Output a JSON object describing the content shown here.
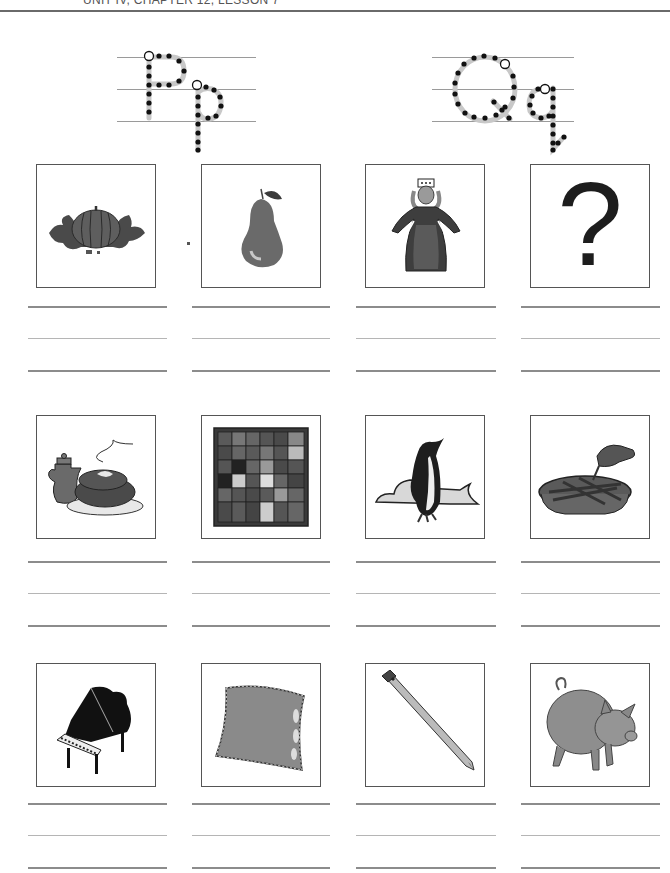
{
  "header": {
    "lesson_label": "UNIT IV, CHAPTER 12, LESSON 7"
  },
  "letters": [
    {
      "name": "P",
      "upper": "P",
      "lower": "p"
    },
    {
      "name": "Q",
      "upper": "Q",
      "lower": "q"
    }
  ],
  "pictures": [
    {
      "row": 1,
      "col": 1,
      "subject": "pumpkin",
      "icon": "pumpkin-icon"
    },
    {
      "row": 1,
      "col": 2,
      "subject": "pear",
      "icon": "pear-icon"
    },
    {
      "row": 1,
      "col": 3,
      "subject": "queen",
      "icon": "queen-icon"
    },
    {
      "row": 1,
      "col": 4,
      "subject": "question mark",
      "icon": "question-mark-icon",
      "glyph": "?"
    },
    {
      "row": 2,
      "col": 1,
      "subject": "pot roast",
      "icon": "pot-roast-icon"
    },
    {
      "row": 2,
      "col": 2,
      "subject": "quilt",
      "icon": "quilt-icon"
    },
    {
      "row": 2,
      "col": 3,
      "subject": "penguin",
      "icon": "penguin-icon"
    },
    {
      "row": 2,
      "col": 4,
      "subject": "pie",
      "icon": "pie-icon"
    },
    {
      "row": 3,
      "col": 1,
      "subject": "piano",
      "icon": "piano-icon"
    },
    {
      "row": 3,
      "col": 2,
      "subject": "pillow",
      "icon": "pillow-icon"
    },
    {
      "row": 3,
      "col": 3,
      "subject": "pencil",
      "icon": "pencil-icon"
    },
    {
      "row": 3,
      "col": 4,
      "subject": "pig",
      "icon": "pig-icon"
    }
  ],
  "colors": {
    "ink": "#1d1d1d",
    "box_border": "#555555",
    "writing_line": "#8c8c8c",
    "trace_dot": "#111111",
    "trace_path": "#c8c8c8"
  }
}
